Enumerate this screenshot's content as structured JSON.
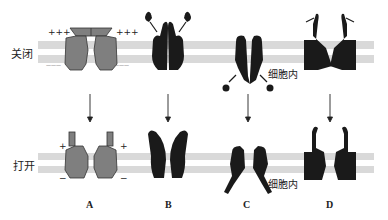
{
  "rows": {
    "closed_label": "关闭",
    "open_label": "打开"
  },
  "panels": [
    {
      "id": "A",
      "letter": "A",
      "mechanism": "voltage-gated"
    },
    {
      "id": "B",
      "letter": "B",
      "mechanism": "extracellular-ligand-gated"
    },
    {
      "id": "C",
      "letter": "C",
      "mechanism": "intracellular-ligand-gated"
    },
    {
      "id": "D",
      "letter": "D",
      "mechanism": "mechanically-gated"
    }
  ],
  "annotations": {
    "intracellular_closed": "细胞内",
    "intracellular_open": "细胞内",
    "charge_plus_closed": "+++",
    "charge_minus_closed": "———",
    "charge_plus_open": "+",
    "charge_minus_open": "−"
  },
  "colors": {
    "membrane": "#d9d9d9",
    "voltage_channel": "#7f7f7f",
    "channel_dark": "#1a1a1a"
  }
}
